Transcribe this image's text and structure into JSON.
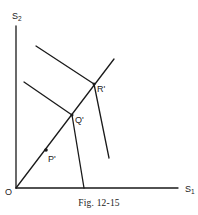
{
  "figure": {
    "caption": "Fig. 12-15",
    "axes": {
      "x_label": "S",
      "x_sub": "1",
      "y_label": "S",
      "y_sub": "2",
      "origin_label": "O"
    },
    "points": [
      {
        "label": "P'",
        "x": 46,
        "y": 150
      },
      {
        "label": "Q'",
        "x": 72,
        "y": 115
      },
      {
        "label": "R'",
        "x": 94,
        "y": 84
      }
    ]
  }
}
